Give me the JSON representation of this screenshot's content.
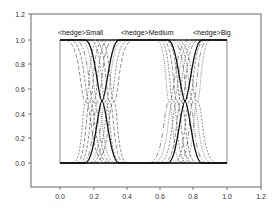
{
  "chart_data": {
    "type": "line",
    "title": "",
    "xlabel": "",
    "ylabel": "",
    "xlim": [
      -0.17,
      1.2
    ],
    "ylim": [
      -0.2,
      1.2
    ],
    "grid": false,
    "legend": "none",
    "x_ticks": [
      "0.0",
      "0.2",
      "0.4",
      "0.6",
      "0.8",
      "1.0",
      "1.2"
    ],
    "y_ticks": [
      "0.0",
      "0.2",
      "0.4",
      "0.6",
      "0.8",
      "1.0",
      "1.2"
    ],
    "annotations": [
      {
        "text": "<hedge>Small",
        "x": 0.0,
        "y": 1.05
      },
      {
        "text": "<hedge>Medium",
        "x": 0.35,
        "y": 1.05
      },
      {
        "text": "<hedge>Big",
        "x": 0.78,
        "y": 1.05
      }
    ],
    "series": [
      {
        "name": "Small",
        "style": "solid-bold",
        "shape": "decreasing-S",
        "points": [
          [
            0.0,
            1.0
          ],
          [
            0.15,
            1.0
          ],
          [
            0.25,
            0.5
          ],
          [
            0.35,
            0.0
          ],
          [
            1.0,
            0.0
          ]
        ]
      },
      {
        "name": "Medium",
        "style": "solid-bold",
        "shape": "trapezoid",
        "points": [
          [
            0.0,
            0.0
          ],
          [
            0.15,
            0.0
          ],
          [
            0.25,
            0.5
          ],
          [
            0.35,
            1.0
          ],
          [
            0.65,
            1.0
          ],
          [
            0.75,
            0.5
          ],
          [
            0.85,
            0.0
          ],
          [
            1.0,
            0.0
          ]
        ]
      },
      {
        "name": "Big",
        "style": "solid-bold",
        "shape": "increasing-S",
        "points": [
          [
            0.0,
            0.0
          ],
          [
            0.65,
            0.0
          ],
          [
            0.75,
            0.5
          ],
          [
            0.85,
            1.0
          ],
          [
            1.0,
            1.0
          ]
        ]
      },
      {
        "name": "hedged variants",
        "style": "dashed/dotted",
        "count": 18,
        "note": "shifted/sharpened versions of each base function around the crossovers at 0.25 and 0.75"
      }
    ]
  },
  "labels": {
    "small": "<hedge>Small",
    "medium": "<hedge>Medium",
    "big": "<hedge>Big"
  }
}
